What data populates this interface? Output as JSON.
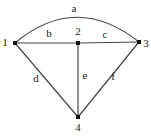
{
  "diagram": {
    "type": "graph",
    "background": "#ffffff",
    "stroke_color": "#454545",
    "node_color": "#111111",
    "label_color": "#1a1a1a",
    "nodes": [
      {
        "id": "1",
        "x": 15,
        "y": 43,
        "label": "1",
        "label_x": 5,
        "label_y": 42
      },
      {
        "id": "2",
        "x": 78,
        "y": 43,
        "label": "2",
        "label_x": 78,
        "label_y": 31
      },
      {
        "id": "3",
        "x": 139,
        "y": 42,
        "label": "3",
        "label_x": 146,
        "label_y": 43
      },
      {
        "id": "4",
        "x": 78,
        "y": 117,
        "label": "4",
        "label_x": 78,
        "label_y": 127
      }
    ],
    "edges": [
      {
        "id": "a",
        "from": "1",
        "to": "3",
        "kind": "arc",
        "control_x": 76,
        "control_y": -8,
        "label": "a",
        "label_x": 74,
        "label_y": 8
      },
      {
        "id": "b",
        "from": "1",
        "to": "2",
        "kind": "line",
        "label": "b",
        "label_x": 49,
        "label_y": 33
      },
      {
        "id": "c",
        "from": "2",
        "to": "3",
        "kind": "line",
        "label": "c",
        "label_x": 105,
        "label_y": 34
      },
      {
        "id": "d",
        "from": "1",
        "to": "4",
        "kind": "line",
        "label": "d",
        "label_x": 36,
        "label_y": 78
      },
      {
        "id": "e",
        "from": "2",
        "to": "4",
        "kind": "line",
        "label": "e",
        "label_x": 85,
        "label_y": 75
      },
      {
        "id": "f",
        "from": "3",
        "to": "4",
        "kind": "line",
        "label": "f",
        "label_x": 113,
        "label_y": 76
      }
    ]
  }
}
